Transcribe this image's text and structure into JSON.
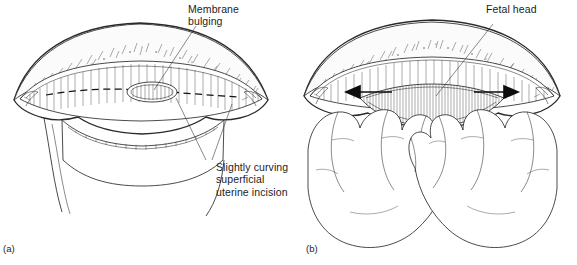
{
  "figure": {
    "background_color": "#ffffff",
    "ink_color": "#1c1c1c",
    "panels": [
      {
        "caption": "(a)",
        "labels": [
          {
            "name": "membrane-bulging",
            "lines": [
              "Membrane",
              "bulging"
            ]
          },
          {
            "name": "uterine-incision",
            "lines": [
              "Slightly curving",
              "superficial",
              "uterine incision"
            ]
          }
        ],
        "features": [
          "uterine serosa",
          "myometrium",
          "dashed incision line",
          "bulging membrane",
          "lower uterine segment"
        ]
      },
      {
        "caption": "(b)",
        "labels": [
          {
            "name": "fetal-head",
            "lines": [
              "Fetal head"
            ]
          }
        ],
        "features": [
          "spread uterine incision",
          "left arrow",
          "right arrow",
          "left hand fingers",
          "right hand fingers",
          "fetal head"
        ]
      }
    ]
  },
  "panel_a": {
    "caption": "(a)",
    "label_membrane_line1": "Membrane",
    "label_membrane_line2": "bulging",
    "label_incision_line1": "Slightly curving",
    "label_incision_line2": "superficial",
    "label_incision_line3": "uterine incision"
  },
  "panel_b": {
    "caption": "(b)",
    "label_fetal_head": "Fetal head"
  }
}
